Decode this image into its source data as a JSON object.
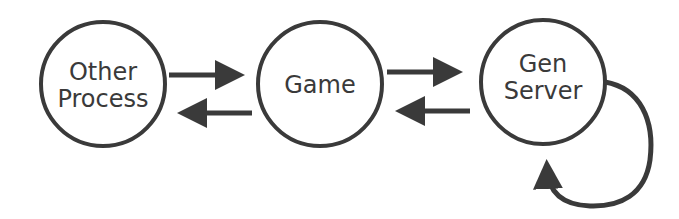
{
  "diagram": {
    "colors": {
      "stroke": "#3a3a3a",
      "background": "#ffffff"
    },
    "nodes": [
      {
        "id": "other-process",
        "lines": [
          "Other",
          "Process"
        ]
      },
      {
        "id": "game",
        "lines": [
          "Game"
        ]
      },
      {
        "id": "gen-server",
        "lines": [
          "Gen",
          "Server"
        ]
      }
    ],
    "edges": [
      {
        "from": "other-process",
        "to": "game"
      },
      {
        "from": "game",
        "to": "other-process"
      },
      {
        "from": "game",
        "to": "gen-server"
      },
      {
        "from": "gen-server",
        "to": "game"
      },
      {
        "from": "gen-server",
        "to": "gen-server"
      }
    ]
  }
}
